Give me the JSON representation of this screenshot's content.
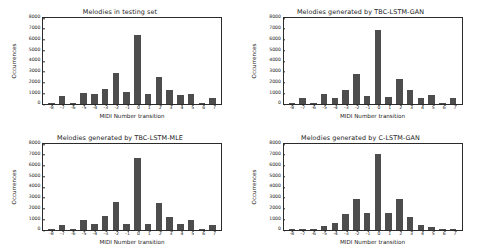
{
  "figure": {
    "background": "#ffffff",
    "bar_color": "#4d4d4d",
    "axis_color": "#2b2b2b",
    "layout": "2x2 subplot grid"
  },
  "chart_data": [
    {
      "type": "bar",
      "title": "Melodies in testing set",
      "xlabel": "MIDI Number transition",
      "ylabel": "Occurrences",
      "categories": [
        "-8",
        "-7",
        "-6",
        "-5",
        "-4",
        "-3",
        "-2",
        "-1",
        "0",
        "1",
        "2",
        "3",
        "4",
        "5",
        "6",
        "7"
      ],
      "values": [
        50,
        700,
        60,
        1050,
        900,
        1400,
        2900,
        1150,
        6400,
        950,
        2500,
        1300,
        800,
        950,
        60,
        550
      ],
      "ylim": [
        0,
        8000
      ],
      "yticks": [
        0,
        1000,
        2000,
        3000,
        4000,
        5000,
        6000,
        7000,
        8000
      ],
      "grid": false,
      "legend": "none"
    },
    {
      "type": "bar",
      "title": "Melodies generated by TBC-LSTM-GAN",
      "xlabel": "MIDI Number transition",
      "ylabel": "Occurrences",
      "categories": [
        "-8",
        "-7",
        "-6",
        "-5",
        "-4",
        "-3",
        "-2",
        "-1",
        "0",
        "1",
        "2",
        "3",
        "4",
        "5",
        "6",
        "7"
      ],
      "values": [
        100,
        550,
        40,
        900,
        600,
        1350,
        2800,
        750,
        6900,
        650,
        2350,
        1300,
        600,
        800,
        40,
        600
      ],
      "ylim": [
        0,
        8000
      ],
      "yticks": [
        0,
        1000,
        2000,
        3000,
        4000,
        5000,
        6000,
        7000,
        8000
      ],
      "grid": false,
      "legend": "none"
    },
    {
      "type": "bar",
      "title": "Melodies generated by TBC-LSTM-MLE",
      "xlabel": "MIDI Number transition",
      "ylabel": "Occurrences",
      "categories": [
        "-8",
        "-7",
        "-6",
        "-5",
        "-4",
        "-3",
        "-2",
        "-1",
        "0",
        "1",
        "2",
        "3",
        "4",
        "5",
        "6",
        "7"
      ],
      "values": [
        60,
        500,
        50,
        950,
        600,
        1350,
        2650,
        550,
        6700,
        550,
        2550,
        1200,
        550,
        900,
        40,
        500
      ],
      "ylim": [
        0,
        8000
      ],
      "yticks": [
        0,
        1000,
        2000,
        3000,
        4000,
        5000,
        6000,
        7000,
        8000
      ],
      "grid": false,
      "legend": "none"
    },
    {
      "type": "bar",
      "title": "Melodies generated by C-LSTM-GAN",
      "xlabel": "MIDI Number transition",
      "ylabel": "Occurrences",
      "categories": [
        "-8",
        "-7",
        "-6",
        "-5",
        "-4",
        "-3",
        "-2",
        "-1",
        "0",
        "1",
        "2",
        "3",
        "4",
        "5",
        "6",
        "7"
      ],
      "values": [
        40,
        90,
        40,
        400,
        650,
        1500,
        2850,
        1550,
        7050,
        1600,
        2850,
        1200,
        500,
        250,
        30,
        30
      ],
      "ylim": [
        0,
        8000
      ],
      "yticks": [
        0,
        1000,
        2000,
        3000,
        4000,
        5000,
        6000,
        7000,
        8000
      ],
      "grid": false,
      "legend": "none"
    }
  ]
}
